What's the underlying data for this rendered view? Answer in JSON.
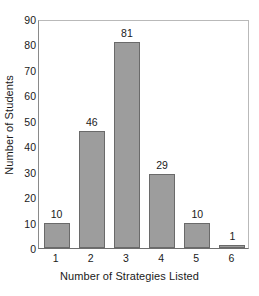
{
  "chart_data": {
    "type": "bar",
    "title": "",
    "xlabel": "Number of Strategies Listed",
    "ylabel": "Number of Students",
    "categories": [
      "1",
      "2",
      "3",
      "4",
      "5",
      "6"
    ],
    "values": [
      10,
      46,
      81,
      29,
      10,
      1
    ],
    "value_labels": [
      "10",
      "46",
      "81",
      "29",
      "10",
      "1"
    ],
    "ylim": [
      0,
      90
    ],
    "ytick_step": 10,
    "ytick_labels": [
      "0",
      "10",
      "20",
      "30",
      "40",
      "50",
      "60",
      "70",
      "80",
      "90"
    ],
    "ytick_values": [
      0,
      10,
      20,
      30,
      40,
      50,
      60,
      70,
      80,
      90
    ],
    "xtick_labels": [
      "1",
      "2",
      "3",
      "4",
      "5",
      "6"
    ],
    "grid": false,
    "legend": false,
    "series": [
      {
        "name": "Number of Students",
        "values": [
          10,
          46,
          81,
          29,
          10,
          1
        ]
      }
    ],
    "colors": {
      "bar_fill": "#9d9d9d",
      "bar_edge": "#6a6a6a",
      "axis": "#6e6e6e",
      "frame": "#b9b9b9",
      "text": "#1a1a1a",
      "background": "#ffffff"
    }
  }
}
